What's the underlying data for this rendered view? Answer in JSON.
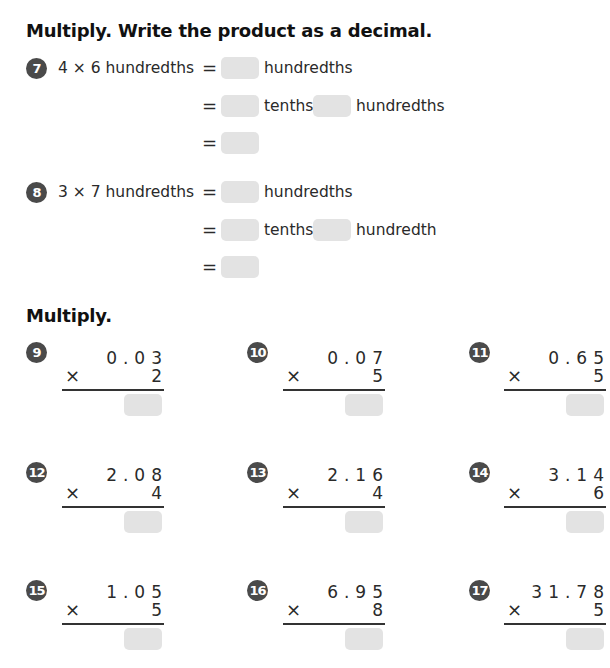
{
  "section1": {
    "heading": "Multiply. Write the product as a decimal.",
    "problems": [
      {
        "number": "7",
        "expression": "4 × 6 hundredths",
        "lines": [
          {
            "eq": "=",
            "after": "hundredths"
          },
          {
            "eq": "=",
            "mid": "tenths",
            "after": "hundredths"
          },
          {
            "eq": "="
          }
        ]
      },
      {
        "number": "8",
        "expression": "3 × 7 hundredths",
        "lines": [
          {
            "eq": "=",
            "after": "hundredths"
          },
          {
            "eq": "=",
            "mid": "tenths",
            "after": "hundredth"
          },
          {
            "eq": "="
          }
        ]
      }
    ]
  },
  "section2": {
    "heading": "Multiply.",
    "times_symbol": "×",
    "problems": [
      {
        "number": "9",
        "top": "0.03",
        "multiplier": "2"
      },
      {
        "number": "10",
        "top": "0.07",
        "multiplier": "5"
      },
      {
        "number": "11",
        "top": "0.65",
        "multiplier": "5"
      },
      {
        "number": "12",
        "top": "2.08",
        "multiplier": "4"
      },
      {
        "number": "13",
        "top": "2.16",
        "multiplier": "4"
      },
      {
        "number": "14",
        "top": "3.14",
        "multiplier": "6"
      },
      {
        "number": "15",
        "top": "1.05",
        "multiplier": "5"
      },
      {
        "number": "16",
        "top": "6.95",
        "multiplier": "8"
      },
      {
        "number": "17",
        "top": "31.78",
        "multiplier": "5"
      }
    ]
  },
  "colors": {
    "badge": "#4a4a4a",
    "answer_box": "#e3e3e3",
    "text": "#2a2a2a"
  }
}
